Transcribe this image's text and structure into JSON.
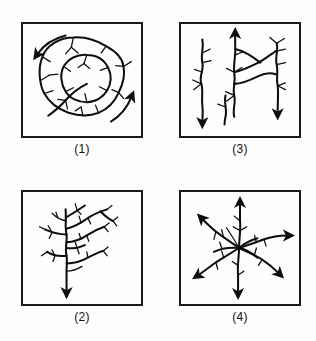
{
  "figure": {
    "caption_style": "parenthesized-numerals",
    "background_color": "#fdfdfd",
    "ink_color": "#0d0d0d",
    "panel_border_color": "#1a1a1a",
    "panel_count": 4,
    "grid": "2x2"
  },
  "panels": [
    {
      "id": "panel-1",
      "label": "(1)",
      "position": "top-left",
      "pattern_name": "annular",
      "description": "Concentric irregular ring-shaped stream courses with short radial tributaries and two curved flow arrows",
      "flow_arrows": 2,
      "ring_count": 2
    },
    {
      "id": "panel-3",
      "label": "(3)",
      "position": "top-right",
      "pattern_name": "trellis",
      "description": "Sub-parallel vertical trunk streams joined by short right-angle tributaries, three flow arrows",
      "flow_arrows": 3,
      "trunk_count": 3
    },
    {
      "id": "panel-2",
      "label": "(2)",
      "position": "bottom-left",
      "pattern_name": "dendritic",
      "description": "Tree-like branching network converging into a single trunk with a downward flow arrow",
      "flow_arrows": 1,
      "branch_orders": 4
    },
    {
      "id": "panel-4",
      "label": "(4)",
      "position": "bottom-right",
      "pattern_name": "radial",
      "description": "Streams radiating outward from a central high point, seven arrows pointing away from center",
      "flow_arrows": 7,
      "radial_spokes": 7
    }
  ]
}
